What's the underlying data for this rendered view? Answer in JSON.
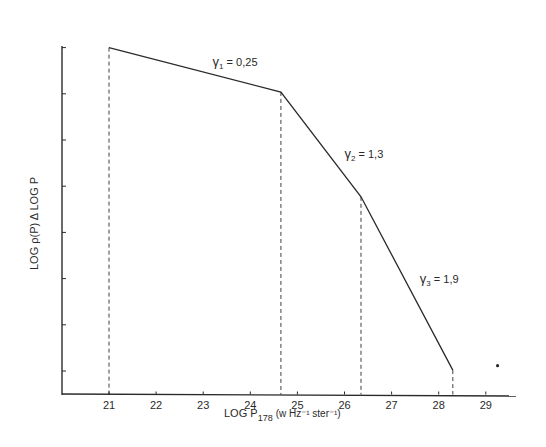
{
  "chart_data": {
    "type": "line",
    "title": "",
    "xlabel": "LOG P178 (w Hz⁻¹ ster⁻¹)",
    "xlabel_parts": {
      "prefix": "LOG P",
      "subscript": "178",
      "units": "(w Hz⁻¹ ster⁻¹)"
    },
    "ylabel": "LOG ρ(P) Δ LOG P",
    "xlim": [
      20.0,
      29.6
    ],
    "ylim": [
      -0.5,
      7.5
    ],
    "x_ticks": [
      21,
      22,
      23,
      24,
      25,
      26,
      27,
      28,
      29
    ],
    "y_ticks_count": 8,
    "y_ticks_labeled": false,
    "grid": false,
    "legend": null,
    "series": [
      {
        "name": "luminosity function (broken power law)",
        "style": "solid",
        "x": [
          21.0,
          24.65,
          26.35,
          28.3
        ],
        "y": [
          7.0,
          6.04,
          3.77,
          0.02
        ]
      }
    ],
    "dropdown_lines": [
      {
        "x": 21.0,
        "y_top": 7.0
      },
      {
        "x": 24.65,
        "y_top": 6.04
      },
      {
        "x": 26.35,
        "y_top": 3.77
      },
      {
        "x": 28.3,
        "y_top": 0.02
      }
    ],
    "annotations": [
      {
        "text": "γ1 = 0,25",
        "symbol": "γ",
        "subscript": "1",
        "value": "= 0,25",
        "x": 23.2,
        "y": 6.6
      },
      {
        "text": "γ2 = 1,3",
        "symbol": "γ",
        "subscript": "2",
        "value": "= 1,3",
        "x": 26.0,
        "y": 4.6
      },
      {
        "text": "γ3 = 1,9",
        "symbol": "γ",
        "subscript": "3",
        "value": "= 1,9",
        "x": 27.6,
        "y": 1.9
      }
    ],
    "extra_points": [
      {
        "x": 29.25,
        "y": 0.05,
        "marker": "dot"
      }
    ]
  },
  "colors": {
    "ink": "#2a2a2a",
    "background": "#ffffff"
  }
}
